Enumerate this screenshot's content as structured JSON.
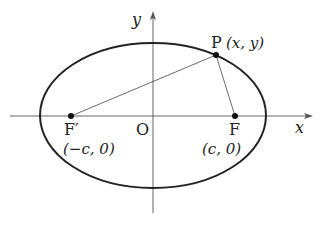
{
  "diagram": {
    "colors": {
      "stroke": "#222222",
      "background": "#ffffff"
    },
    "axes": {
      "x_label": "x",
      "y_label": "y",
      "origin_label": "O"
    },
    "point_p": {
      "name": "P",
      "coords": "(x, y)"
    },
    "focus_right": {
      "name": "F",
      "coords": "(c, 0)"
    },
    "focus_left": {
      "name": "F′",
      "coords": "(−c, 0)"
    }
  }
}
